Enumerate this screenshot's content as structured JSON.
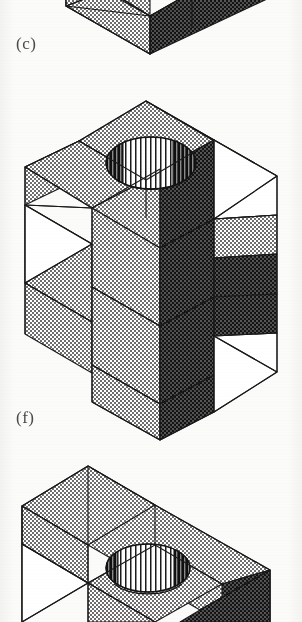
{
  "page": {
    "width": 302,
    "height": 622,
    "background_color": "#fbfbfa",
    "kind": "scanned-textbook-figure-page"
  },
  "palette": {
    "ink": "#1a1a1a",
    "light_stipple": "#d9d9d9",
    "light_stipple_dot": "#3a3a3a",
    "dark_stipple": "#2b2b2b",
    "dark_stipple_dot": "#0a0a0a",
    "white_face": "#ffffff",
    "caption_color": "#4a4a4a"
  },
  "figures": [
    {
      "id": "figure-c",
      "caption": "(c)",
      "caption_x": 16,
      "caption_y": 44,
      "cropped": "top",
      "note": "Bottom portion of an isometric stepped block; upper part runs off the top edge of the page.",
      "faces": [
        {
          "name": "top-left-light",
          "shade": "light"
        },
        {
          "name": "front-left-light",
          "shade": "light"
        },
        {
          "name": "front-right-dark",
          "shade": "dark"
        },
        {
          "name": "step-top-light",
          "shade": "light"
        },
        {
          "name": "side-right-dark",
          "shade": "dark"
        }
      ],
      "has_hole": false
    },
    {
      "id": "figure-f",
      "caption": "(f)",
      "caption_x": 16,
      "caption_y": 420,
      "cropped": "none",
      "note": "Full isometric cube-like block: stepped notch on the left, large rectangular slot on the right, cylindrical through-hole bored into the raised top face.",
      "faces": [
        {
          "name": "top-face-light",
          "shade": "light"
        },
        {
          "name": "upper-step-top-light",
          "shade": "light"
        },
        {
          "name": "left-face-light",
          "shade": "light"
        },
        {
          "name": "front-left-light",
          "shade": "light"
        },
        {
          "name": "front-right-dark",
          "shade": "dark"
        },
        {
          "name": "slot-interior-dark",
          "shade": "dark"
        },
        {
          "name": "slot-opening-white",
          "shade": "white"
        },
        {
          "name": "notch-opening-white",
          "shade": "white"
        },
        {
          "name": "lower-slot-white",
          "shade": "white"
        }
      ],
      "has_hole": true,
      "hole": {
        "type": "cylindrical-through-hole",
        "hatching": "vertical-lines",
        "cx": 151,
        "cy": 163,
        "rx": 45,
        "ry": 26
      }
    },
    {
      "id": "figure-unlabeled-bottom",
      "caption": "",
      "cropped": "bottom",
      "note": "Top portion of a third isometric block with a cylindrical through-hole; lower part runs off the bottom edge of the page.",
      "faces": [
        {
          "name": "top-face-light",
          "shade": "light"
        },
        {
          "name": "step-top-light",
          "shade": "light"
        },
        {
          "name": "left-face-light",
          "shade": "light"
        },
        {
          "name": "front-right-dark",
          "shade": "dark"
        },
        {
          "name": "notch-opening-white",
          "shade": "white"
        }
      ],
      "has_hole": true,
      "hole": {
        "type": "cylindrical-through-hole",
        "hatching": "vertical-lines",
        "cx": 148,
        "cy": 568,
        "rx": 42,
        "ry": 24
      }
    }
  ]
}
